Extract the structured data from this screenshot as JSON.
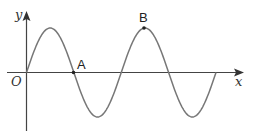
{
  "diagram": {
    "type": "sine-wave-graph",
    "axes": {
      "x_label": "x",
      "y_label": "y",
      "origin_label": "O"
    },
    "curve": {
      "description": "Two full periods of y = sin(x) starting at origin",
      "periods": 2,
      "color": "#777777"
    },
    "points": [
      {
        "label": "A",
        "description": "zero crossing at half period",
        "x_px": 73,
        "y_px": 72
      },
      {
        "label": "B",
        "description": "maximum in second period",
        "x_px": 144,
        "y_px": 28
      }
    ],
    "colors": {
      "axis": "#444444",
      "curve": "#777777",
      "point": "#222222"
    }
  }
}
